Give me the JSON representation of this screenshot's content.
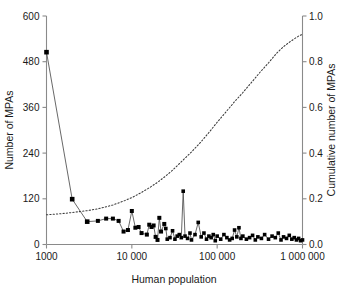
{
  "chart_data": {
    "type": "line",
    "title": "",
    "subtitle": "",
    "xlabel": "Human population",
    "ylabel": "Number of MPAs",
    "y2label": "Cumulative number of MPAs",
    "xscale": "log",
    "xlim": [
      1000,
      1000000
    ],
    "ylim": [
      0,
      600
    ],
    "y2lim": [
      0,
      1.0
    ],
    "grid": false,
    "legend": null,
    "xticks": [
      1000,
      10000,
      100000,
      1000000
    ],
    "xticklabels": [
      "1000",
      "10 000",
      "100 000",
      "1 000 000"
    ],
    "yticks": [
      0,
      120,
      240,
      360,
      480,
      600
    ],
    "yticklabels": [
      "0",
      "120",
      "240",
      "360",
      "480",
      "600"
    ],
    "y2ticks": [
      0.0,
      0.2,
      0.4,
      0.6,
      0.8,
      1.0
    ],
    "y2ticklabels": [
      "0.0",
      "0.2",
      "0.4",
      "0.6",
      "0.8",
      "1.0"
    ],
    "colors": {
      "marker": "#000000",
      "line": "#4d4d4d",
      "cumulative": "#3a3a3a",
      "axis": "#8a8a8a",
      "background": "#ffffff"
    },
    "series": [
      {
        "name": "Number of MPAs",
        "axis": "left",
        "style": "line-with-square-markers",
        "x": [
          1000,
          2000,
          3000,
          4000,
          5000,
          6000,
          7000,
          8000,
          9000,
          10000,
          11000,
          12000,
          13000,
          15000,
          16000,
          17000,
          18000,
          19000,
          20000,
          21000,
          22000,
          24000,
          25000,
          26000,
          28000,
          30000,
          32000,
          34000,
          36000,
          38000,
          40000,
          42000,
          45000,
          48000,
          50000,
          55000,
          60000,
          65000,
          70000,
          75000,
          80000,
          85000,
          90000,
          95000,
          100000,
          110000,
          120000,
          130000,
          140000,
          150000,
          160000,
          170000,
          180000,
          190000,
          200000,
          220000,
          240000,
          260000,
          280000,
          300000,
          330000,
          360000,
          400000,
          440000,
          480000,
          520000,
          560000,
          600000,
          650000,
          700000,
          750000,
          800000,
          850000,
          900000,
          950000,
          1000000
        ],
        "y": [
          505,
          119,
          60,
          62,
          68,
          68,
          62,
          34,
          38,
          88,
          44,
          46,
          30,
          26,
          52,
          46,
          50,
          20,
          12,
          70,
          34,
          54,
          42,
          14,
          18,
          36,
          14,
          22,
          26,
          18,
          140,
          22,
          16,
          30,
          12,
          26,
          58,
          20,
          30,
          14,
          22,
          18,
          26,
          10,
          22,
          14,
          26,
          18,
          12,
          16,
          38,
          20,
          44,
          16,
          22,
          14,
          18,
          24,
          12,
          20,
          16,
          26,
          14,
          22,
          18,
          30,
          12,
          20,
          16,
          24,
          14,
          18,
          12,
          16,
          10,
          12
        ]
      },
      {
        "name": "Cumulative number of MPAs",
        "axis": "right",
        "style": "dotted-line",
        "x": [
          1000,
          1500,
          2000,
          3000,
          4000,
          5000,
          6000,
          8000,
          10000,
          13000,
          16000,
          20000,
          25000,
          30000,
          40000,
          50000,
          65000,
          80000,
          100000,
          130000,
          160000,
          200000,
          260000,
          320000,
          400000,
          500000,
          600000,
          700000,
          800000,
          900000,
          1000000
        ],
        "y": [
          0.13,
          0.135,
          0.14,
          0.148,
          0.156,
          0.165,
          0.173,
          0.19,
          0.205,
          0.228,
          0.248,
          0.272,
          0.3,
          0.325,
          0.37,
          0.405,
          0.45,
          0.49,
          0.535,
          0.585,
          0.625,
          0.665,
          0.715,
          0.755,
          0.795,
          0.838,
          0.866,
          0.885,
          0.9,
          0.912,
          0.92
        ]
      }
    ]
  }
}
